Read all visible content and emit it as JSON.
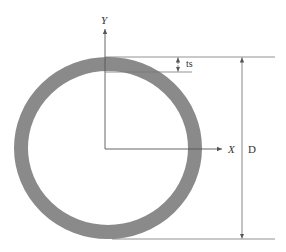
{
  "diagram": {
    "labels": {
      "y_axis": "Y",
      "x_axis": "X",
      "thickness": "ts",
      "diameter": "D"
    },
    "colors": {
      "ring": "#8a8a8a",
      "line": "#555555",
      "text": "#333333",
      "background": "#ffffff"
    }
  }
}
